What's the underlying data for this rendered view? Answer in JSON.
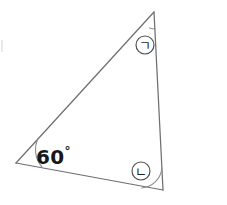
{
  "figure": {
    "kind": "geometry-diagram",
    "background_color": "#ffffff",
    "stroke_color": "#6d6f72",
    "label_color": "#171819",
    "width": 227,
    "height": 205
  },
  "triangle": {
    "name": "scalene-triangle",
    "vertices": [
      {
        "id": "top",
        "x": 154,
        "y": 12
      },
      {
        "id": "bottom-right",
        "x": 163,
        "y": 190
      },
      {
        "id": "bottom-left",
        "x": 16,
        "y": 163
      }
    ],
    "edges": [
      {
        "id": "left-edge",
        "from": "bottom-left",
        "to": "top"
      },
      {
        "id": "right-edge",
        "from": "top",
        "to": "bottom-right"
      },
      {
        "id": "bottom-edge",
        "from": "bottom-right",
        "to": "bottom-left"
      }
    ]
  },
  "angles": [
    {
      "id": "angle-top",
      "vertex": "top",
      "marker_type": "circled-symbol",
      "marker_symbol": "ㄱ",
      "marker_reading": "giyeok",
      "marker_x": 145,
      "marker_y": 45,
      "marker_radius": 9,
      "value": null,
      "has_arc": true
    },
    {
      "id": "angle-bottom-right",
      "vertex": "bottom-right",
      "marker_type": "circled-symbol",
      "marker_symbol": "ㄴ",
      "marker_reading": "nieun",
      "marker_x": 141,
      "marker_y": 171,
      "marker_radius": 9,
      "value": null,
      "has_arc": true
    },
    {
      "id": "angle-bottom-left",
      "vertex": "bottom-left",
      "marker_type": "numeric-label",
      "marker_symbol": null,
      "value": "60",
      "degree_symbol": "°",
      "has_arc": true
    }
  ]
}
